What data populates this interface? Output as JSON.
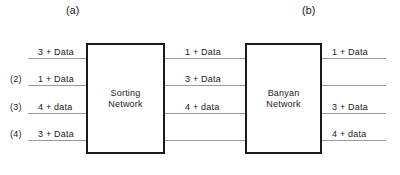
{
  "figure": {
    "panels": [
      {
        "caption": "(a)",
        "x": 66,
        "y": 4
      },
      {
        "caption": "(b)",
        "x": 302,
        "y": 4
      }
    ],
    "blocks": [
      {
        "id": "sorting-network",
        "label": "Sorting\nNetwork",
        "x": 86,
        "y": 43,
        "w": 79,
        "h": 111
      },
      {
        "id": "banyan-network",
        "label": "Banyan\nNetwork",
        "x": 245,
        "y": 43,
        "w": 77,
        "h": 111
      }
    ],
    "wire_groups": [
      {
        "id": "input-wires",
        "x": 28,
        "w": 58,
        "wires": [
          {
            "index": "",
            "label": "3 + Data",
            "y": 58,
            "label_x": 38,
            "index_x": 10
          },
          {
            "index": "(2)",
            "label": "1 + Data",
            "y": 85,
            "label_x": 38,
            "index_x": 10
          },
          {
            "index": "(3)",
            "label": "4 + data",
            "y": 113,
            "label_x": 38,
            "index_x": 10
          },
          {
            "index": "(4)",
            "label": "3 + Data",
            "y": 140,
            "label_x": 38,
            "index_x": 10
          }
        ]
      },
      {
        "id": "interconnect-wires",
        "x": 165,
        "w": 80,
        "wires": [
          {
            "index": "",
            "label": "1 + Data",
            "y": 58,
            "label_x": 185,
            "index_x": 0
          },
          {
            "index": "",
            "label": "3 + Data",
            "y": 85,
            "label_x": 185,
            "index_x": 0
          },
          {
            "index": "",
            "label": "4 + data",
            "y": 113,
            "label_x": 185,
            "index_x": 0
          },
          {
            "index": "",
            "label": "",
            "y": 140,
            "label_x": 185,
            "index_x": 0
          }
        ]
      },
      {
        "id": "output-wires",
        "x": 322,
        "w": 64,
        "wires": [
          {
            "index": "",
            "label": "1 + Data",
            "y": 58,
            "label_x": 332,
            "index_x": 0
          },
          {
            "index": "",
            "label": "",
            "y": 85,
            "label_x": 332,
            "index_x": 0
          },
          {
            "index": "",
            "label": "3 + Data",
            "y": 113,
            "label_x": 332,
            "index_x": 0
          },
          {
            "index": "",
            "label": "4 + data",
            "y": 140,
            "label_x": 332,
            "index_x": 0
          }
        ]
      }
    ]
  }
}
